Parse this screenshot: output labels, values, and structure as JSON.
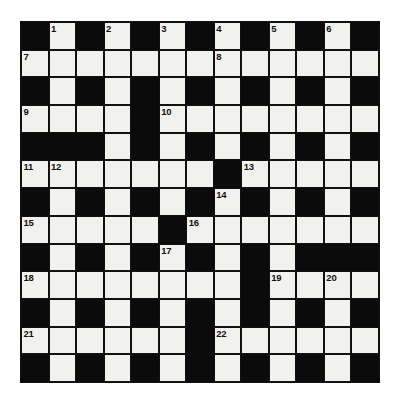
{
  "puzzle": {
    "title": "Crossword Grid",
    "type": "crossword",
    "size": {
      "rows": 13,
      "cols": 13
    },
    "colors": {
      "block": "#0b0b0b",
      "cell": "#f1f1ee",
      "grid_line": "#111111",
      "number": "#111111",
      "page_background": "#ffffff"
    },
    "legend": {
      "block_symbol": "#",
      "open_symbol": "."
    },
    "grid": [
      "#.#.#.#.#.#.#",
      ".............",
      "#.#.#.#.#.#.#",
      "....#........",
      "###.#.#.#.#.#",
      ".......#.....",
      "#.#.#.#.#.#.#",
      ".....#.......",
      "#.#.#.#.#.###",
      "........#....",
      "#.#.#.#.#.#.#",
      "......#......",
      "#.#.#.#.#.#.#"
    ],
    "numbers": [
      {
        "n": 1,
        "row": 0,
        "col": 1
      },
      {
        "n": 2,
        "row": 0,
        "col": 3
      },
      {
        "n": 3,
        "row": 0,
        "col": 5
      },
      {
        "n": 4,
        "row": 0,
        "col": 7
      },
      {
        "n": 5,
        "row": 0,
        "col": 9
      },
      {
        "n": 6,
        "row": 0,
        "col": 11
      },
      {
        "n": 7,
        "row": 1,
        "col": 0
      },
      {
        "n": 8,
        "row": 1,
        "col": 7
      },
      {
        "n": 9,
        "row": 3,
        "col": 0
      },
      {
        "n": 10,
        "row": 3,
        "col": 5
      },
      {
        "n": 11,
        "row": 5,
        "col": 0
      },
      {
        "n": 12,
        "row": 5,
        "col": 1
      },
      {
        "n": 13,
        "row": 5,
        "col": 8
      },
      {
        "n": 14,
        "row": 6,
        "col": 7
      },
      {
        "n": 15,
        "row": 7,
        "col": 0
      },
      {
        "n": 16,
        "row": 7,
        "col": 6
      },
      {
        "n": 17,
        "row": 8,
        "col": 5
      },
      {
        "n": 18,
        "row": 9,
        "col": 0
      },
      {
        "n": 19,
        "row": 9,
        "col": 9
      },
      {
        "n": 20,
        "row": 9,
        "col": 11
      },
      {
        "n": 21,
        "row": 11,
        "col": 0
      },
      {
        "n": 22,
        "row": 11,
        "col": 7
      }
    ]
  }
}
